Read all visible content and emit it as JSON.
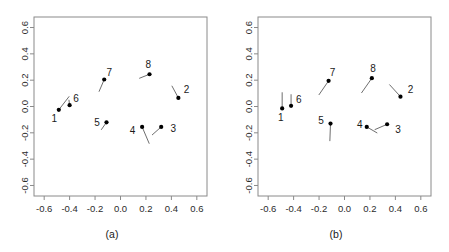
{
  "figure": {
    "type": "two-panel-scatter-figure",
    "panel_count": 2,
    "background_color": "#ffffff",
    "frame_color": "#8a8a8a",
    "point_color": "#000000",
    "tail_color": "#5d5d5d"
  },
  "panels": [
    {
      "id": "a",
      "caption": "(a)"
    },
    {
      "id": "b",
      "caption": "(b)"
    }
  ],
  "axis": {
    "x_ticks": [
      "-0.6",
      "-0.4",
      "-0.2",
      "0.0",
      "0.2",
      "0.4",
      "0.6"
    ],
    "y_ticks": [
      "-0.6",
      "-0.4",
      "-0.2",
      "0.0",
      "0.2",
      "0.4",
      "0.6"
    ],
    "x_tick_values": [
      -0.6,
      -0.4,
      -0.2,
      0.0,
      0.2,
      0.4,
      0.6
    ],
    "y_tick_values": [
      -0.6,
      -0.4,
      -0.2,
      0.0,
      0.2,
      0.4,
      0.6
    ],
    "xlim": [
      -0.68,
      0.68
    ],
    "ylim": [
      -0.68,
      0.68
    ],
    "xlabel": "",
    "ylabel": "",
    "grid": false
  },
  "chart_data": [
    {
      "type": "scatter",
      "title": "(a)",
      "subtitle": "",
      "xlabel": "",
      "ylabel": "",
      "xlim": [
        -0.68,
        0.68
      ],
      "ylim": [
        -0.68,
        0.68
      ],
      "xticks": [
        -0.6,
        -0.4,
        -0.2,
        0.0,
        0.2,
        0.4,
        0.6
      ],
      "yticks": [
        -0.6,
        -0.4,
        -0.2,
        0.0,
        0.2,
        0.4,
        0.6
      ],
      "grid": false,
      "legend": "none",
      "points": [
        {
          "label": "1",
          "x": -0.485,
          "y": -0.025,
          "tail_x": -0.405,
          "tail_y": 0.075,
          "label_dx": -0.035,
          "label_dy": -0.075
        },
        {
          "label": "2",
          "x": 0.455,
          "y": 0.065,
          "tail_x": 0.405,
          "tail_y": 0.155,
          "label_dx": 0.065,
          "label_dy": 0.055
        },
        {
          "label": "3",
          "x": 0.32,
          "y": -0.155,
          "tail_x": 0.25,
          "tail_y": -0.215,
          "label_dx": 0.095,
          "label_dy": -0.02
        },
        {
          "label": "4",
          "x": 0.17,
          "y": -0.155,
          "tail_x": 0.225,
          "tail_y": -0.28,
          "label_dx": -0.075,
          "label_dy": -0.035
        },
        {
          "label": "5",
          "x": -0.11,
          "y": -0.12,
          "tail_x": -0.15,
          "tail_y": -0.175,
          "label_dx": -0.075,
          "label_dy": -0.01
        },
        {
          "label": "6",
          "x": -0.4,
          "y": 0.01,
          "tail_x": -0.405,
          "tail_y": 0.048,
          "label_dx": 0.05,
          "label_dy": 0.045
        },
        {
          "label": "7",
          "x": -0.128,
          "y": 0.205,
          "tail_x": -0.168,
          "tail_y": 0.115,
          "label_dx": 0.04,
          "label_dy": 0.05
        },
        {
          "label": "8",
          "x": 0.228,
          "y": 0.245,
          "tail_x": 0.15,
          "tail_y": 0.215,
          "label_dx": -0.01,
          "label_dy": 0.07
        }
      ]
    },
    {
      "type": "scatter",
      "title": "(b)",
      "subtitle": "",
      "xlabel": "",
      "ylabel": "",
      "xlim": [
        -0.68,
        0.68
      ],
      "ylim": [
        -0.68,
        0.68
      ],
      "xticks": [
        -0.6,
        -0.4,
        -0.2,
        0.0,
        0.2,
        0.4,
        0.6
      ],
      "yticks": [
        -0.6,
        -0.4,
        -0.2,
        0.0,
        0.2,
        0.4,
        0.6
      ],
      "grid": false,
      "legend": "none",
      "points": [
        {
          "label": "1",
          "x": -0.49,
          "y": -0.015,
          "tail_x": -0.49,
          "tail_y": 0.105,
          "label_dx": -0.01,
          "label_dy": -0.075
        },
        {
          "label": "2",
          "x": 0.44,
          "y": 0.075,
          "tail_x": 0.355,
          "tail_y": 0.165,
          "label_dx": 0.08,
          "label_dy": 0.045
        },
        {
          "label": "3",
          "x": 0.335,
          "y": -0.135,
          "tail_x": 0.24,
          "tail_y": -0.175,
          "label_dx": 0.085,
          "label_dy": -0.045
        },
        {
          "label": "4",
          "x": 0.175,
          "y": -0.155,
          "tail_x": 0.255,
          "tail_y": -0.2,
          "label_dx": -0.055,
          "label_dy": 0.015
        },
        {
          "label": "5",
          "x": -0.11,
          "y": -0.13,
          "tail_x": -0.115,
          "tail_y": -0.26,
          "label_dx": -0.075,
          "label_dy": 0.015
        },
        {
          "label": "6",
          "x": -0.42,
          "y": 0.005,
          "tail_x": -0.42,
          "tail_y": 0.09,
          "label_dx": 0.06,
          "label_dy": 0.045
        },
        {
          "label": "7",
          "x": -0.125,
          "y": 0.195,
          "tail_x": -0.2,
          "tail_y": 0.09,
          "label_dx": 0.03,
          "label_dy": 0.06
        },
        {
          "label": "8",
          "x": 0.215,
          "y": 0.215,
          "tail_x": 0.135,
          "tail_y": 0.105,
          "label_dx": 0.01,
          "label_dy": 0.07
        }
      ]
    }
  ]
}
